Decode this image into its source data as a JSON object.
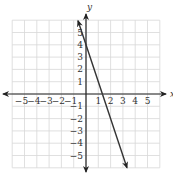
{
  "chart_data": {
    "type": "line",
    "title": "",
    "xlabel": "x",
    "ylabel": "y",
    "xlim": [
      -6,
      6
    ],
    "ylim": [
      -6,
      6
    ],
    "grid": true,
    "x_ticks": [
      -5,
      -4,
      -3,
      -2,
      -1,
      1,
      2,
      3,
      4,
      5
    ],
    "y_ticks": [
      -5,
      -4,
      -3,
      -2,
      -1,
      1,
      2,
      3,
      4,
      5
    ],
    "x_tick_labels": [
      "−5",
      "−4",
      "−3",
      "−2",
      "−1",
      "1",
      "2",
      "3",
      "4",
      "5"
    ],
    "y_tick_labels": [
      "−5",
      "−4",
      "−3",
      "−2",
      "−1",
      "1",
      "2",
      "3",
      "4",
      "5"
    ],
    "series": [
      {
        "name": "y = -3x + 4",
        "equation": "y = -3x + 4",
        "slope": -3,
        "intercept": 4,
        "x": [
          -0.65,
          3.33
        ],
        "y": [
          5.95,
          -6.0
        ],
        "arrows": "both"
      }
    ],
    "legend": null
  },
  "colors": {
    "grid": "#d8d8d8",
    "axis": "#222222",
    "line": "#333333",
    "text": "#333333"
  }
}
